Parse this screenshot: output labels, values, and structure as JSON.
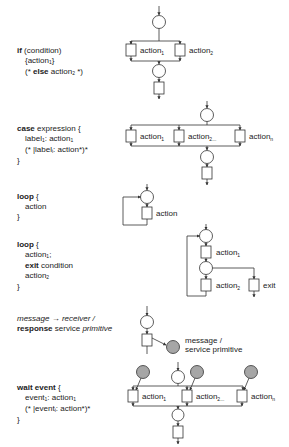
{
  "constructs": [
    {
      "id": "if",
      "lines": [
        {
          "kw": "if",
          "text": " (condition)"
        },
        {
          "text": "{action",
          "sub": "1",
          "tail": "}"
        },
        {
          "pre": "(* ",
          "kw": "else",
          "text": " action",
          "sub": "2",
          "tail": " *)"
        }
      ],
      "labels": [
        "action",
        "action"
      ],
      "subs": [
        "1",
        "2"
      ]
    },
    {
      "id": "case",
      "lines": [
        {
          "kw": "case",
          "text": " expression {"
        },
        {
          "text": "label",
          "sub": "1",
          "tail": ": action"
        },
        {
          "text": "(* |label",
          "sub": "i",
          "tail": ": action*)*"
        },
        {
          "text": "}"
        }
      ],
      "labels": [
        "action",
        "action",
        "action"
      ],
      "subs": [
        "1",
        "2...",
        "n"
      ]
    },
    {
      "id": "loop",
      "lines": [
        {
          "kw": "loop",
          "text": " {"
        },
        {
          "text": "action"
        },
        {
          "text": "}"
        }
      ],
      "labels": [
        "action"
      ]
    },
    {
      "id": "loop-exit",
      "lines": [
        {
          "kw": "loop",
          "text": " {"
        },
        {
          "text": "action",
          "sub": "1",
          "tail": ";"
        },
        {
          "kw": "exit",
          "text": " condition"
        },
        {
          "text": "action",
          "sub": "2"
        },
        {
          "text": "}"
        }
      ],
      "labels": [
        "action",
        "action",
        "exit"
      ],
      "subs": [
        "1",
        "2",
        ""
      ]
    },
    {
      "id": "message",
      "lines": [
        {
          "italic": "message → receiver /"
        },
        {
          "kw": "response",
          "text": " service ",
          "italic2": "primitive"
        }
      ],
      "labels": [
        "message /",
        "service primitive"
      ]
    },
    {
      "id": "wait",
      "lines": [
        {
          "kw": "wait event",
          "text": " {"
        },
        {
          "text": "event",
          "sub": "1",
          "tail": ": action"
        },
        {
          "text": "(* |event",
          "sub": "i",
          "tail": ": action*)*"
        },
        {
          "text": "}"
        }
      ],
      "labels": [
        "action",
        "action",
        "action"
      ],
      "subs": [
        "1",
        "2...",
        "n"
      ]
    }
  ],
  "colors": {
    "stroke": "#333333",
    "event_fill": "#a6a6a6",
    "text": "#222222"
  }
}
